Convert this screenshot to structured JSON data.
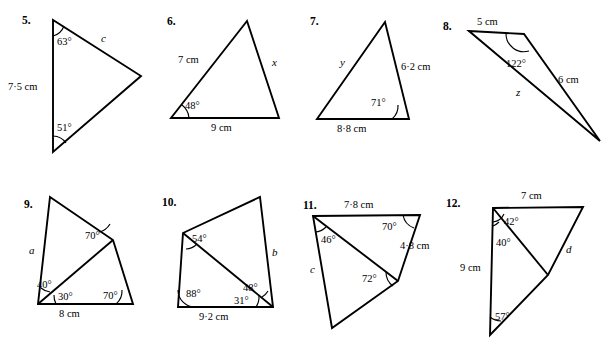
{
  "page": {
    "kind": "geometry-worksheet",
    "background_color": "#ffffff",
    "ink_color": "#000000",
    "width": 605,
    "height": 362
  },
  "problems": [
    {
      "number": "5.",
      "shape": "triangle",
      "angles": [
        "63°",
        "51°"
      ],
      "sides": [
        "7·5 cm"
      ],
      "unknowns": [
        "c"
      ]
    },
    {
      "number": "6.",
      "shape": "triangle",
      "angles": [
        "48°"
      ],
      "sides": [
        "7 cm",
        "9 cm"
      ],
      "unknowns": [
        "x"
      ]
    },
    {
      "number": "7.",
      "shape": "triangle",
      "angles": [
        "71°"
      ],
      "sides": [
        "6·2 cm",
        "8·8 cm"
      ],
      "unknowns": [
        "y"
      ]
    },
    {
      "number": "8.",
      "shape": "triangle",
      "angles": [
        "122°"
      ],
      "sides": [
        "5 cm",
        "6 cm"
      ],
      "unknowns": [
        "z"
      ]
    },
    {
      "number": "9.",
      "shape": "quadrilateral-with-diagonal",
      "angles": [
        "70°",
        "40°",
        "30°",
        "70°"
      ],
      "sides": [
        "8 cm"
      ],
      "unknowns": [
        "a"
      ]
    },
    {
      "number": "10.",
      "shape": "quadrilateral-with-diagonal",
      "angles": [
        "54°",
        "88°",
        "31°",
        "48°"
      ],
      "sides": [
        "9·2 cm"
      ],
      "unknowns": [
        "b"
      ]
    },
    {
      "number": "11.",
      "shape": "quadrilateral-with-diagonal",
      "angles": [
        "46°",
        "70°",
        "72°"
      ],
      "sides": [
        "7·8 cm",
        "4·8 cm"
      ],
      "unknowns": [
        "c"
      ]
    },
    {
      "number": "12.",
      "shape": "quadrilateral-with-diagonal",
      "angles": [
        "42°",
        "40°",
        "57°"
      ],
      "sides": [
        "7 cm",
        "9 cm"
      ],
      "unknowns": [
        "d"
      ]
    }
  ],
  "labels": {
    "p5": {
      "number": "5.",
      "angle_top": "63°",
      "angle_bottom": "51°",
      "side_left": "7·5 cm",
      "unknown_c": "c"
    },
    "p6": {
      "number": "6.",
      "angle_left": "48°",
      "side_upper_left": "7 cm",
      "side_bottom": "9 cm",
      "unknown_x": "x"
    },
    "p7": {
      "number": "7.",
      "angle_right": "71°",
      "side_right": "6·2 cm",
      "side_bottom": "8·8 cm",
      "unknown_y": "y"
    },
    "p8": {
      "number": "8.",
      "angle_top": "122°",
      "side_top": "5 cm",
      "side_right": "6 cm",
      "unknown_z": "z"
    },
    "p9": {
      "number": "9.",
      "angle_mid": "70°",
      "angle_upper_left": "40°",
      "angle_lower_left": "30°",
      "angle_right": "70°",
      "side_bottom": "8 cm",
      "unknown_a": "a"
    },
    "p10": {
      "number": "10.",
      "angle_top_left": "54°",
      "angle_bottom_left": "88°",
      "angle_inner_right": "31°",
      "angle_outer_right": "48°",
      "side_bottom": "9·2 cm",
      "unknown_b": "b"
    },
    "p11": {
      "number": "11.",
      "angle_left": "46°",
      "angle_top_right": "70°",
      "angle_mid": "72°",
      "side_top": "7·8 cm",
      "side_right": "4·8 cm",
      "unknown_c": "c"
    },
    "p12": {
      "number": "12.",
      "angle_top": "42°",
      "angle_upper_left": "40°",
      "angle_bottom": "57°",
      "side_top": "7 cm",
      "side_left": "9 cm",
      "unknown_d": "d"
    }
  }
}
